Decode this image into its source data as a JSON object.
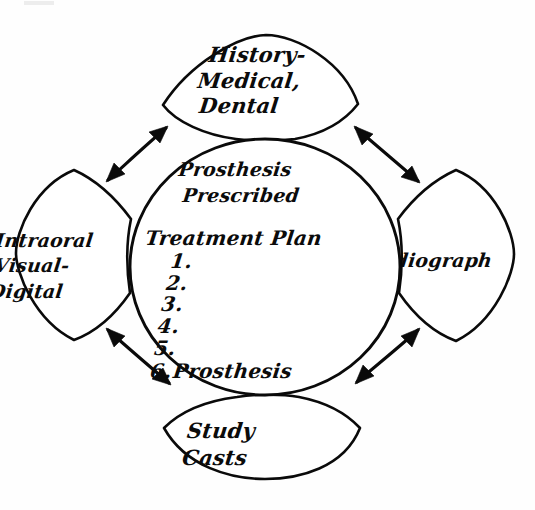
{
  "diagram": {
    "style": {
      "ink_color": "#0a0a0a",
      "paper_color": "#fefefe"
    },
    "center": {
      "name": "center-circle",
      "heading_line_1": "Prosthesis",
      "heading_line_2": "Prescribed",
      "plan_title": "Treatment Plan",
      "plan_items": [
        {
          "number": "1.",
          "text": ""
        },
        {
          "number": "2.",
          "text": ""
        },
        {
          "number": "3.",
          "text": ""
        },
        {
          "number": "4.",
          "text": ""
        },
        {
          "number": "5.",
          "text": ""
        },
        {
          "number": "6.",
          "text": "Prosthesis"
        }
      ]
    },
    "wedges": [
      {
        "id": "top",
        "name": "wedge-history",
        "lines": [
          "History-",
          "Medical,",
          "Dental"
        ]
      },
      {
        "id": "right",
        "name": "wedge-radiograph",
        "lines": [
          "Radiograph"
        ]
      },
      {
        "id": "bottom",
        "name": "wedge-study-casts",
        "lines": [
          "Study",
          "Casts"
        ]
      },
      {
        "id": "left",
        "name": "wedge-intraoral",
        "lines": [
          "Intraoral",
          "Visual-",
          "Digital"
        ]
      }
    ],
    "arrows": [
      {
        "id": "top-left",
        "name": "arrow-intraoral-history",
        "style": "double-headed-curved"
      },
      {
        "id": "top-right",
        "name": "arrow-history-radiograph",
        "style": "double-headed-curved"
      },
      {
        "id": "bottom-right",
        "name": "arrow-radiograph-studycasts",
        "style": "double-headed-curved"
      },
      {
        "id": "bottom-left",
        "name": "arrow-studycasts-intraoral",
        "style": "double-headed-curved"
      }
    ]
  }
}
